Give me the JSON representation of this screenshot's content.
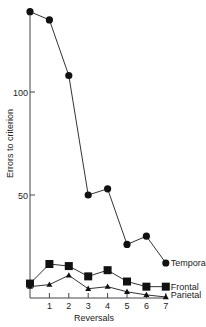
{
  "chart_data": {
    "type": "line",
    "title": "",
    "xlabel": "Reversals",
    "ylabel": "Errors to criterion",
    "x": [
      0,
      1,
      2,
      3,
      4,
      5,
      6,
      7
    ],
    "x_tick_labels": [
      "1",
      "2",
      "3",
      "4",
      "5",
      "6",
      "7"
    ],
    "y_ticks": [
      50,
      100
    ],
    "ylim": [
      0,
      140
    ],
    "xlim": [
      0,
      7
    ],
    "grid": false,
    "legend_position": "inline-right-end",
    "series": [
      {
        "name": "Temporal",
        "marker": "circle",
        "values": [
          139,
          135,
          108,
          50,
          53,
          26,
          30,
          17
        ]
      },
      {
        "name": "Frontal",
        "marker": "square",
        "values": [
          7,
          16.5,
          15.5,
          10.5,
          13.5,
          8,
          5.5,
          5.5
        ]
      },
      {
        "name": "Parietal",
        "marker": "triangle",
        "values": [
          5.5,
          6.5,
          11,
          4.5,
          5.5,
          3,
          1.5,
          0.5
        ]
      }
    ]
  },
  "colors": {
    "line": "#333333",
    "marker": "#111111",
    "axis": "#444444"
  }
}
